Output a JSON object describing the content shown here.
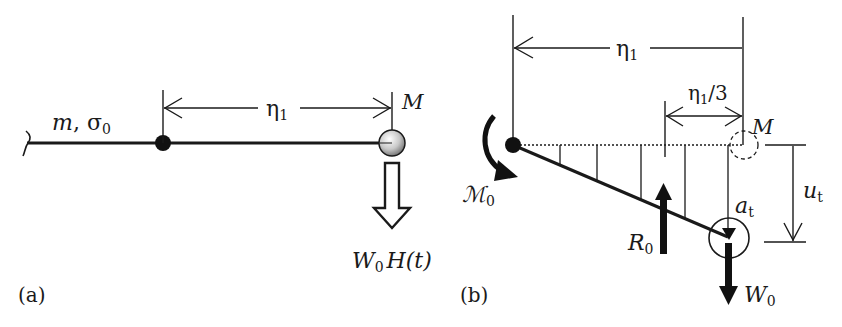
{
  "panel_a": {
    "caption": "(a)",
    "string_label": {
      "main": "m",
      "sep": ", ",
      "sym": "σ",
      "sub": "0"
    },
    "span_label": {
      "main": "η",
      "sub": "1"
    },
    "mass_label": "M",
    "load_label": {
      "main": "W",
      "sub": "0",
      "rest": "H(t)"
    }
  },
  "panel_b": {
    "caption": "(b)",
    "span_label": {
      "main": "η",
      "sub": "1"
    },
    "third_label": {
      "main": "η",
      "sub": "1",
      "rest": "/3"
    },
    "mass_label": "M",
    "moment_label": {
      "main": "ℳ",
      "sub": "0"
    },
    "reaction_label": {
      "main": "R",
      "sub": "0"
    },
    "accel_label": {
      "main": "a",
      "sub": "t"
    },
    "weight_label": {
      "main": "W",
      "sub": "0"
    },
    "deflection_label": {
      "main": "u",
      "sub": "t"
    }
  },
  "colors": {
    "ink": "#1a1a1a",
    "mass_fill": "#c8c8c8"
  }
}
